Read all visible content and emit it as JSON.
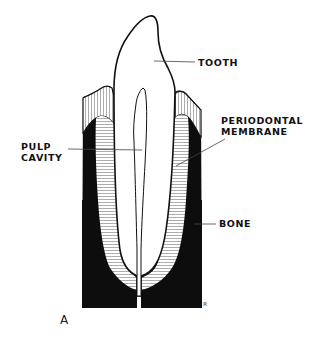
{
  "figure": {
    "panel_letter": "A",
    "labels": {
      "tooth": "TOOTH",
      "pulp_cavity_line1": "PULP",
      "pulp_cavity_line2": "CAVITY",
      "periodontal_line1": "PERIODONTAL",
      "periodontal_line2": "MEMBRANE",
      "bone": "BONE"
    },
    "artist_mark": "ʀ",
    "colors": {
      "ink": "#111111",
      "bone_fill": "#0d0d0d",
      "membrane_hatch": "#777777",
      "background": "#ffffff"
    }
  }
}
